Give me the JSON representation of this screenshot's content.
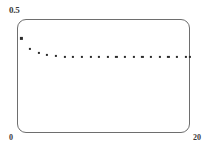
{
  "figure": {
    "background_color": "#ffffff",
    "frame_color": "#6e6e6e",
    "marker_color": "#2b2b2b",
    "label_color": "#3a3a3a"
  },
  "axes": {
    "y_max_label": "0.5",
    "y_min_label": "0",
    "x_max_label": "20"
  },
  "chart_data": {
    "type": "scatter",
    "title": "",
    "subtitle": "",
    "xlabel": "",
    "ylabel": "",
    "xlim": [
      0,
      20
    ],
    "ylim": [
      0,
      0.5
    ],
    "grid": false,
    "legend": null,
    "xticklabels": [
      "0",
      "20"
    ],
    "yticklabels": [
      "0",
      "0.5"
    ],
    "marker": "square",
    "marker_size": 2.2,
    "annotations": [],
    "series": [
      {
        "name": "series-1",
        "x": [
          0.5,
          1.5,
          2.5,
          3.5,
          4.5,
          5.5,
          6.5,
          7.5,
          8.5,
          9.5,
          10.5,
          11.5,
          12.5,
          13.5,
          14.5,
          15.5,
          16.5,
          17.5,
          18.5,
          19.5,
          20.0
        ],
        "y": [
          0.415,
          0.368,
          0.35,
          0.341,
          0.337,
          0.335,
          0.334,
          0.333,
          0.333,
          0.333,
          0.332,
          0.332,
          0.332,
          0.332,
          0.332,
          0.332,
          0.332,
          0.332,
          0.332,
          0.332,
          0.332
        ]
      }
    ]
  }
}
